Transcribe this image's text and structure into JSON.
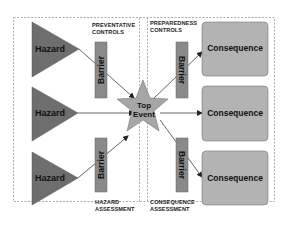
{
  "diagram": {
    "type": "bowtie",
    "sections": {
      "preventative": "PREVENTATIVE\nCONTROLS",
      "preparedness": "PREPAREDNESS\nCONTROLS",
      "hazard_assessment": "HAZARD\nASSESSMENT",
      "consequence_assessment": "CONSEQUENCE\nASSESSMENT"
    },
    "hazards": [
      "Hazard",
      "Hazard",
      "Hazard"
    ],
    "barriers_left": [
      "Barrier",
      "Barrier"
    ],
    "barriers_right": [
      "Barrier",
      "Barrier"
    ],
    "top_event": {
      "line1": "Top",
      "line2": "Event"
    },
    "consequences": [
      "Consequence",
      "Consequence",
      "Consequence"
    ],
    "colors": {
      "hazard": "#6e6e6e",
      "barrier": "#8a8a8a",
      "star": "#a6a6a6",
      "consequence": "#b3b3b3",
      "border": "#888888"
    }
  }
}
